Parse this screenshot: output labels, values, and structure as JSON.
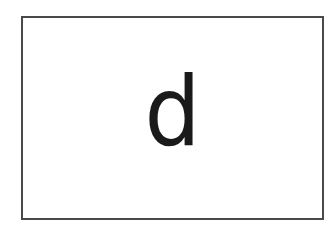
{
  "card": {
    "letter": "d",
    "border_color": "#4a4a4a",
    "background_color": "#ffffff",
    "text_color": "#1a1a1a"
  }
}
